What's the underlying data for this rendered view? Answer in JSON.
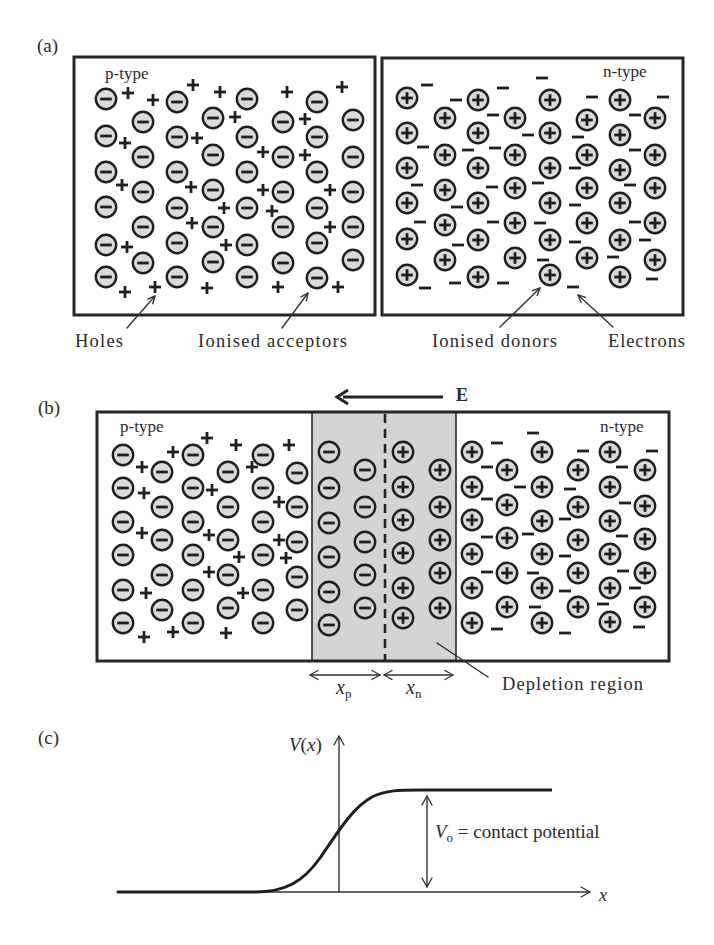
{
  "colors": {
    "ink": "#1f1f1f",
    "ion_fill": "#dadada",
    "depletion_fill": "#d4d4d4",
    "depletion_ion_fill": "#d4d4d4",
    "background": "#ffffff"
  },
  "panel_a": {
    "label": "(a)",
    "p_type_label": "p-type",
    "n_type_label": "n-type",
    "annotations": {
      "holes": "Holes",
      "ionised_acceptors": "Ionised acceptors",
      "ionised_donors": "Ionised donors",
      "electrons": "Electrons"
    },
    "ionised_acceptors": [
      {
        "x": 106,
        "y": [
          99,
          136,
          172,
          207,
          245,
          277
        ]
      },
      {
        "x": 143,
        "y": [
          122,
          157,
          192,
          227,
          263
        ]
      },
      {
        "x": 177,
        "y": [
          102,
          137,
          172,
          208,
          243,
          277
        ]
      },
      {
        "x": 213,
        "y": [
          118,
          155,
          190,
          227,
          262
        ]
      },
      {
        "x": 247,
        "y": [
          99,
          137,
          172,
          208,
          245,
          277
        ]
      },
      {
        "x": 283,
        "y": [
          122,
          157,
          192,
          227,
          263
        ]
      },
      {
        "x": 317,
        "y": [
          102,
          137,
          172,
          208,
          243,
          278
        ]
      },
      {
        "x": 353,
        "y": [
          120,
          157,
          192,
          227,
          260
        ]
      }
    ],
    "holes": [
      [
        128,
        93
      ],
      [
        153,
        100
      ],
      [
        193,
        85
      ],
      [
        220,
        92
      ],
      [
        287,
        92
      ],
      [
        342,
        87
      ],
      [
        235,
        117
      ],
      [
        305,
        119
      ],
      [
        125,
        143
      ],
      [
        197,
        138
      ],
      [
        263,
        152
      ],
      [
        305,
        155
      ],
      [
        122,
        185
      ],
      [
        191,
        187
      ],
      [
        263,
        190
      ],
      [
        330,
        190
      ],
      [
        224,
        208
      ],
      [
        272,
        211
      ],
      [
        192,
        223
      ],
      [
        330,
        227
      ],
      [
        127,
        247
      ],
      [
        226,
        245
      ],
      [
        125,
        292
      ],
      [
        155,
        287
      ],
      [
        207,
        288
      ],
      [
        278,
        287
      ],
      [
        338,
        287
      ]
    ],
    "ionised_donors": [
      {
        "x": 407,
        "y": [
          98,
          133,
          168,
          203,
          239,
          275
        ]
      },
      {
        "x": 445,
        "y": [
          118,
          155,
          190,
          225,
          260
        ]
      },
      {
        "x": 478,
        "y": [
          100,
          133,
          168,
          203,
          240,
          277
        ]
      },
      {
        "x": 515,
        "y": [
          118,
          155,
          188,
          223,
          258
        ]
      },
      {
        "x": 550,
        "y": [
          100,
          133,
          168,
          203,
          240,
          275
        ]
      },
      {
        "x": 587,
        "y": [
          120,
          155,
          188,
          223,
          258
        ]
      },
      {
        "x": 620,
        "y": [
          100,
          135,
          170,
          203,
          240,
          277
        ]
      },
      {
        "x": 655,
        "y": [
          118,
          155,
          188,
          223,
          260
        ]
      }
    ],
    "electrons": [
      [
        427,
        85
      ],
      [
        456,
        100
      ],
      [
        503,
        88
      ],
      [
        542,
        78
      ],
      [
        592,
        97
      ],
      [
        663,
        97
      ],
      [
        493,
        115
      ],
      [
        635,
        115
      ],
      [
        423,
        147
      ],
      [
        468,
        150
      ],
      [
        495,
        148
      ],
      [
        528,
        135
      ],
      [
        578,
        137
      ],
      [
        635,
        150
      ],
      [
        575,
        168
      ],
      [
        417,
        185
      ],
      [
        492,
        187
      ],
      [
        538,
        183
      ],
      [
        630,
        185
      ],
      [
        457,
        207
      ],
      [
        575,
        205
      ],
      [
        420,
        222
      ],
      [
        493,
        222
      ],
      [
        540,
        223
      ],
      [
        635,
        222
      ],
      [
        458,
        245
      ],
      [
        575,
        242
      ],
      [
        645,
        240
      ],
      [
        543,
        260
      ],
      [
        613,
        257
      ],
      [
        425,
        288
      ],
      [
        455,
        283
      ],
      [
        503,
        283
      ],
      [
        573,
        287
      ],
      [
        652,
        279
      ]
    ]
  },
  "panel_b": {
    "label": "(b)",
    "p_type_label": "p-type",
    "n_type_label": "n-type",
    "field_label": "E",
    "depletion_label": "Depletion region",
    "xp": {
      "symbol": "x",
      "sub": "p"
    },
    "xn": {
      "symbol": "x",
      "sub": "n"
    },
    "ionised_acceptors": [
      {
        "x": 123,
        "y": [
          455,
          488,
          522,
          555,
          590,
          623
        ]
      },
      {
        "x": 162,
        "y": [
          472,
          507,
          540,
          575,
          610
        ]
      },
      {
        "x": 193,
        "y": [
          455,
          488,
          522,
          555,
          590,
          623
        ]
      },
      {
        "x": 228,
        "y": [
          472,
          507,
          540,
          575,
          608
        ]
      },
      {
        "x": 263,
        "y": [
          455,
          488,
          522,
          555,
          590,
          623
        ]
      },
      {
        "x": 297,
        "y": [
          473,
          507,
          542,
          577,
          610
        ]
      }
    ],
    "holes": [
      [
        142,
        467
      ],
      [
        173,
        452
      ],
      [
        207,
        438
      ],
      [
        236,
        445
      ],
      [
        289,
        445
      ],
      [
        252,
        467
      ],
      [
        144,
        493
      ],
      [
        212,
        490
      ],
      [
        279,
        502
      ],
      [
        142,
        533
      ],
      [
        209,
        535
      ],
      [
        279,
        540
      ],
      [
        239,
        557
      ],
      [
        286,
        558
      ],
      [
        209,
        572
      ],
      [
        146,
        593
      ],
      [
        243,
        593
      ],
      [
        144,
        637
      ],
      [
        173,
        632
      ],
      [
        226,
        633
      ]
    ],
    "depletion_acceptors": [
      {
        "x": 329,
        "y": [
          452,
          488,
          523,
          557,
          592,
          625
        ]
      },
      {
        "x": 365,
        "y": [
          470,
          507,
          542,
          575,
          608
        ]
      }
    ],
    "depletion_donors": [
      {
        "x": 403,
        "y": [
          452,
          487,
          520,
          553,
          588,
          618
        ]
      },
      {
        "x": 440,
        "y": [
          470,
          507,
          540,
          573,
          608
        ]
      }
    ],
    "ionised_donors": [
      {
        "x": 472,
        "y": [
          452,
          487,
          520,
          554,
          588,
          623
        ]
      },
      {
        "x": 507,
        "y": [
          470,
          505,
          538,
          573,
          607
        ]
      },
      {
        "x": 542,
        "y": [
          452,
          487,
          521,
          554,
          588,
          623
        ]
      },
      {
        "x": 578,
        "y": [
          470,
          507,
          540,
          573,
          607
        ]
      },
      {
        "x": 610,
        "y": [
          452,
          487,
          521,
          554,
          588,
          622
        ]
      },
      {
        "x": 645,
        "y": [
          470,
          506,
          539,
          573,
          607
        ]
      }
    ],
    "electrons": [
      [
        497,
        443
      ],
      [
        533,
        433
      ],
      [
        583,
        451
      ],
      [
        652,
        451
      ],
      [
        487,
        467
      ],
      [
        622,
        467
      ],
      [
        520,
        487
      ],
      [
        570,
        489
      ],
      [
        487,
        499
      ],
      [
        625,
        503
      ],
      [
        565,
        519
      ],
      [
        487,
        537
      ],
      [
        528,
        534
      ],
      [
        622,
        536
      ],
      [
        565,
        556
      ],
      [
        487,
        572
      ],
      [
        533,
        573
      ],
      [
        623,
        571
      ],
      [
        565,
        591
      ],
      [
        635,
        588
      ],
      [
        535,
        607
      ],
      [
        603,
        604
      ],
      [
        497,
        629
      ],
      [
        565,
        633
      ],
      [
        639,
        627
      ]
    ]
  },
  "panel_c": {
    "label": "(c)",
    "y_axis_label": {
      "func": "V",
      "open": "(",
      "var": "x",
      "close": ")"
    },
    "x_axis_label": "x",
    "vo": {
      "symbol": "V",
      "sub": "o",
      "text": " = contact potential"
    },
    "curve": {
      "description": "sigmoid step from 0 (p-side) to V_o (n-side)",
      "baseline_y": 892,
      "plateau_y": 790,
      "axis_x": 339
    }
  }
}
